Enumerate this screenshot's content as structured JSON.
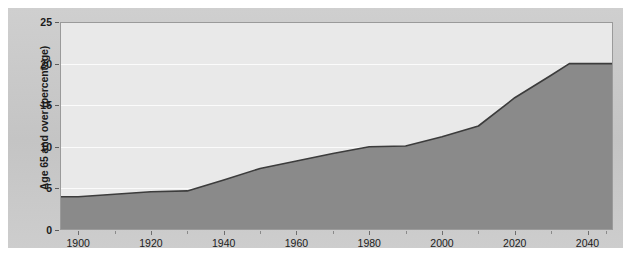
{
  "chart_data": {
    "type": "area",
    "title": "",
    "xlabel": "",
    "ylabel": "Age 65 and over (percentage)",
    "xlim": [
      1895,
      2047
    ],
    "ylim": [
      0,
      25
    ],
    "grid": true,
    "legend": false,
    "x": [
      1900,
      1910,
      1920,
      1930,
      1940,
      1950,
      1960,
      1970,
      1980,
      1990,
      2000,
      2010,
      2020,
      2030,
      2035,
      2040,
      2045
    ],
    "values": [
      4.0,
      4.3,
      4.6,
      4.7,
      6.0,
      7.4,
      8.3,
      9.2,
      10.0,
      10.1,
      11.2,
      12.5,
      15.9,
      18.6,
      20.0,
      20.0,
      20.0
    ],
    "series": [
      {
        "name": "Age 65 and over (percentage)",
        "values": [
          4.0,
          4.3,
          4.6,
          4.7,
          6.0,
          7.4,
          8.3,
          9.2,
          10.0,
          10.1,
          11.2,
          12.5,
          15.9,
          18.6,
          20.0,
          20.0,
          20.0
        ]
      }
    ],
    "yticks": [
      0,
      5,
      10,
      15,
      20,
      25
    ],
    "ytick_labels": [
      "0",
      "5",
      "10",
      "15",
      "20",
      "25"
    ],
    "xticks": [
      1900,
      1920,
      1940,
      1960,
      1980,
      2000,
      2020,
      2040
    ],
    "xtick_labels": [
      "1900",
      "1920",
      "1940",
      "1960",
      "1980",
      "2000",
      "2020",
      "2040"
    ],
    "xticks_minor": [
      1890,
      1910,
      1930,
      1950,
      1970,
      1990,
      2010,
      2030,
      2045
    ],
    "colors": {
      "area_fill": "#8a8a8a",
      "line": "#3c3c3c",
      "plot_background": "#e9e9e9",
      "gridline": "#fbfbfb",
      "panel_background": "#c9c9c9",
      "axis": "#9a9a9a",
      "text": "#1b1b1b"
    }
  }
}
